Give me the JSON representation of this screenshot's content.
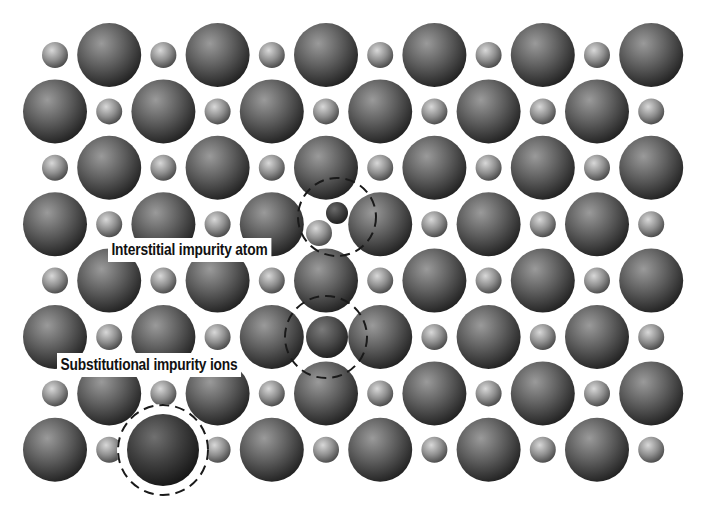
{
  "diagram": {
    "background": "#ffffff",
    "grid": {
      "x0": 55,
      "dx": 54.2,
      "y0": 55,
      "dy": 56.4,
      "cols": 12,
      "rows": 8,
      "large_radius": 32,
      "small_radius": 13,
      "odd_row_starts_with": "small",
      "even_row_starts_with": "large"
    },
    "colors": {
      "large_highlight": "#9a9a9a",
      "large_mid": "#5a5a5a",
      "large_edge": "#222222",
      "small_highlight": "#d6d6d6",
      "small_mid": "#8c8c8c",
      "small_edge": "#4a4a4a",
      "dashed_circle": "#1a1a1a"
    },
    "removed_sites": [
      {
        "row": 3,
        "col": 5
      },
      {
        "row": 5,
        "col": 5
      },
      {
        "row": 7,
        "col": 2
      }
    ],
    "defects": [
      {
        "name": "interstitial-impurity-atom",
        "spheres": [
          {
            "cx": 337,
            "cy": 213,
            "r": 11,
            "shade": "dark-small"
          },
          {
            "cx": 319,
            "cy": 233,
            "r": 13,
            "shade": "small"
          }
        ],
        "dashed_circle": {
          "cx": 337,
          "cy": 217,
          "r": 39,
          "halo": false
        }
      },
      {
        "name": "substitutional-impurity-small",
        "spheres": [
          {
            "cx": 327,
            "cy": 337,
            "r": 21,
            "shade": "dark-medium"
          }
        ],
        "dashed_circle": {
          "cx": 326,
          "cy": 337,
          "r": 41,
          "halo": false
        }
      },
      {
        "name": "substitutional-impurity-large",
        "spheres": [
          {
            "cx": 163,
            "cy": 450,
            "r": 36,
            "shade": "dark-large"
          }
        ],
        "dashed_circle": {
          "cx": 163,
          "cy": 450,
          "r": 45,
          "halo": true
        }
      }
    ],
    "labels": {
      "interstitial": "Interstitial impurity atom",
      "substitutional": "Substitutional impurity ions"
    }
  }
}
